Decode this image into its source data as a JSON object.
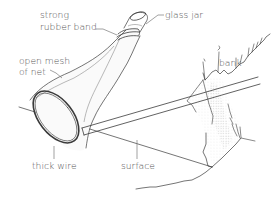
{
  "figure": {
    "labels": {
      "rubber_band_line1": "strong",
      "rubber_band_line2": "rubber band",
      "glass_jar": "glass jar",
      "mesh_line1": "open mesh",
      "mesh_line2": "of net",
      "bank": "bank",
      "thick_wire": "thick wire",
      "surface": "surface"
    },
    "colors": {
      "background": "#ffffff",
      "ink": "#3a3a3a",
      "label": "#555555",
      "stipple": "#bdbdbd"
    }
  }
}
